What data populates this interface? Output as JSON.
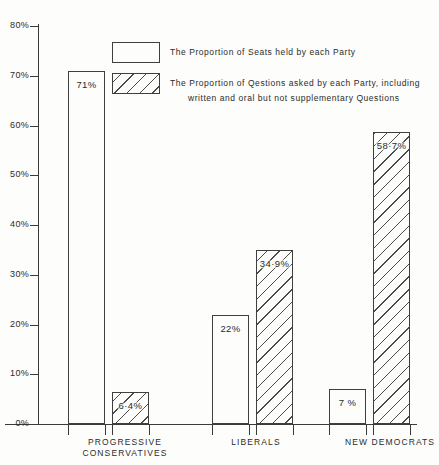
{
  "chart_data": {
    "type": "bar",
    "title": "",
    "xlabel": "",
    "ylabel": "",
    "ylim": [
      0,
      80
    ],
    "grid": false,
    "legend_position": "top-center",
    "ytick_labels": [
      "0%",
      "10%",
      "20%",
      "30%",
      "40%",
      "50%",
      "60%",
      "70%",
      "80%"
    ],
    "ytick_values": [
      0,
      10,
      20,
      30,
      40,
      50,
      60,
      70,
      80
    ],
    "categories": [
      "PROGRESSIVE\nCONSERVATIVES",
      "LIBERALS",
      "NEW DEMOCRATS"
    ],
    "series": [
      {
        "name": "The Proportion of Seats held by each Party",
        "style": "open",
        "values": [
          71,
          22,
          7
        ],
        "labels": [
          "71%",
          "22%",
          "7 %"
        ]
      },
      {
        "name": "The Proportion of Qestions asked by each Party, including written and oral but not supplementary Questions",
        "style": "hatched",
        "values": [
          6.4,
          34.9,
          58.7
        ],
        "labels": [
          "6·4%",
          "34·9%",
          "58·7%"
        ]
      }
    ]
  },
  "legend": {
    "entries": [
      {
        "swatch": "open-rectangle",
        "line1": "The Proportion of  Seats held by each  Party",
        "line2": ""
      },
      {
        "swatch": "hatched-rectangle",
        "line1": "The Proportion of  Qestions asked  by  each  Party, including",
        "line2": "written  and  oral  but  not  supplementary  Questions"
      }
    ]
  },
  "colors": {
    "ink": "#3a3a3a",
    "paper": "#fdfdfb",
    "hatch": "#4a4a4a"
  }
}
